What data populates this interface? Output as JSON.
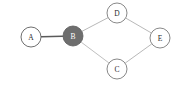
{
  "diagram": {
    "type": "node-link-graph",
    "title": "",
    "background_color": "#ffffff",
    "width": 175,
    "height": 88,
    "node_radius": 10,
    "default_node_fill": "#ffffff",
    "default_node_stroke": "#4a4a4a",
    "default_label_color": "#2b2b2b",
    "highlight_node_fill": "#6e6e6e",
    "highlight_node_stroke": "#5a5a5a",
    "highlight_label_color": "#ffffff",
    "nodes": [
      {
        "id": "A",
        "label": "A",
        "cx": 31,
        "cy": 37,
        "r": 10,
        "highlighted": false,
        "fill": "#ffffff",
        "stroke": "#4a4a4a",
        "label_color": "#2b2b2b"
      },
      {
        "id": "B",
        "label": "B",
        "cx": 73,
        "cy": 36,
        "r": 10,
        "highlighted": true,
        "fill": "#6e6e6e",
        "stroke": "#5a5a5a",
        "label_color": "#ffffff"
      },
      {
        "id": "C",
        "label": "C",
        "cx": 117,
        "cy": 69,
        "r": 10,
        "highlighted": false,
        "fill": "#ffffff",
        "stroke": "#6a6a6a",
        "label_color": "#2b2b2b"
      },
      {
        "id": "D",
        "label": "D",
        "cx": 117,
        "cy": 13,
        "r": 10,
        "highlighted": false,
        "fill": "#ffffff",
        "stroke": "#6a6a6a",
        "label_color": "#2b2b2b"
      },
      {
        "id": "E",
        "label": "E",
        "cx": 160,
        "cy": 38,
        "r": 10,
        "highlighted": false,
        "fill": "#ffffff",
        "stroke": "#6a6a6a",
        "label_color": "#2b2b2b"
      }
    ],
    "edges": [
      {
        "id": "A-B",
        "source": "A",
        "target": "B",
        "color": "#5a5a5a",
        "width": 1.3
      },
      {
        "id": "B-D",
        "source": "B",
        "target": "D",
        "color": "#b0b0b0",
        "width": 0.9
      },
      {
        "id": "B-C",
        "source": "B",
        "target": "C",
        "color": "#b8b8b8",
        "width": 0.9
      },
      {
        "id": "D-E",
        "source": "D",
        "target": "E",
        "color": "#b0b0b0",
        "width": 0.9
      },
      {
        "id": "C-E",
        "source": "C",
        "target": "E",
        "color": "#b0b0b0",
        "width": 0.9
      }
    ]
  }
}
